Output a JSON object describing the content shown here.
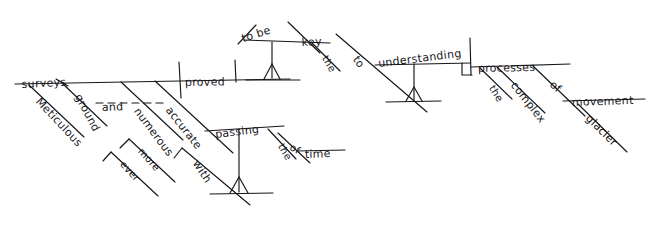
{
  "diagram": {
    "type": "reed-kellogg-sentence-diagram",
    "style": "hand-drawn-pencil",
    "ink_color": "#16161a",
    "background_color": "#ffffff",
    "sentence": "Meticulous ground-surveys, ever more numerous and accurate with the passing of time, proved to be key to understanding the complex processes of glacier movement.",
    "baseline_label": "main-clause-baseline",
    "words": [
      {
        "id": "surveys",
        "text": "surveys",
        "role": "simple-subject",
        "slot": "baseline",
        "x": 22,
        "y": 78,
        "rot": -3,
        "size": "normal"
      },
      {
        "id": "meticulous",
        "text": "Meticulous",
        "role": "adjective-modifier",
        "slot": "slant-under-subject",
        "x": 33,
        "y": 91,
        "rot": 47,
        "size": "normal"
      },
      {
        "id": "ground",
        "text": "ground",
        "role": "compound-noun-modifier",
        "slot": "slant-under-subject",
        "x": 72,
        "y": 85,
        "rot": 62,
        "size": "normal"
      },
      {
        "id": "and",
        "text": "and",
        "role": "coordinating-conjunction",
        "slot": "dashed-conjunction",
        "x": 102,
        "y": 101,
        "rot": -2,
        "size": "normal"
      },
      {
        "id": "numerous",
        "text": "numerous",
        "role": "adjective-modifier",
        "slot": "slant-under-subject",
        "x": 131,
        "y": 100,
        "rot": 53,
        "size": "normal"
      },
      {
        "id": "more",
        "text": "more",
        "role": "adverb-modifier",
        "slot": "slant-sub-branch",
        "x": 136,
        "y": 142,
        "rot": 48,
        "size": "sm"
      },
      {
        "id": "ever",
        "text": "ever",
        "role": "adverb-modifier",
        "slot": "slant-sub-branch",
        "x": 118,
        "y": 155,
        "rot": 48,
        "size": "sm"
      },
      {
        "id": "accurate",
        "text": "accurate",
        "role": "adjective-modifier",
        "slot": "slant-under-subject",
        "x": 163,
        "y": 99,
        "rot": 52,
        "size": "normal"
      },
      {
        "id": "with",
        "text": "with",
        "role": "preposition",
        "slot": "slant-sub-branch",
        "x": 190,
        "y": 152,
        "rot": 57,
        "size": "normal"
      },
      {
        "id": "passing",
        "text": "passing",
        "role": "gerund-object-of-preposition",
        "slot": "pedestal-horizontal",
        "x": 216,
        "y": 128,
        "rot": -7,
        "size": "normal"
      },
      {
        "id": "the",
        "text": "the",
        "role": "article-modifier",
        "slot": "slant-modifier",
        "x": 276,
        "y": 136,
        "rot": 60,
        "size": "sm"
      },
      {
        "id": "of",
        "text": "of",
        "role": "preposition",
        "slot": "slant-modifier",
        "x": 288,
        "y": 140,
        "rot": 30,
        "size": "sm"
      },
      {
        "id": "time",
        "text": "time",
        "role": "object-of-preposition",
        "slot": "horizontal",
        "x": 305,
        "y": 148,
        "rot": -2,
        "size": "normal"
      },
      {
        "id": "proved",
        "text": "proved",
        "role": "main-verb",
        "slot": "baseline",
        "x": 185,
        "y": 76,
        "rot": -1,
        "size": "normal"
      },
      {
        "id": "to-be",
        "text": "to be",
        "role": "infinitive-subject-complement",
        "slot": "pedestal-horizontal",
        "x": 244,
        "y": 32,
        "rot": -18,
        "size": "normal"
      },
      {
        "id": "key",
        "text": "key",
        "role": "predicate-noun",
        "slot": "pedestal-horizontal",
        "x": 302,
        "y": 36,
        "rot": -3,
        "size": "normal"
      },
      {
        "id": "the2",
        "text": "the",
        "role": "article-modifier",
        "slot": "slant-modifier",
        "x": 320,
        "y": 48,
        "rot": 60,
        "size": "sm"
      },
      {
        "id": "to",
        "text": "to",
        "role": "preposition",
        "slot": "slant-modifier",
        "x": 350,
        "y": 48,
        "rot": 55,
        "size": "normal"
      },
      {
        "id": "understanding",
        "text": "understanding",
        "role": "gerund-object-of-preposition",
        "slot": "pedestal-horizontal",
        "x": 379,
        "y": 57,
        "rot": -7,
        "size": "normal"
      },
      {
        "id": "processes",
        "text": "processes",
        "role": "direct-object-of-gerund",
        "slot": "horizontal",
        "x": 478,
        "y": 62,
        "rot": -1,
        "size": "normal"
      },
      {
        "id": "the3",
        "text": "the",
        "role": "article-modifier",
        "slot": "slant-modifier",
        "x": 487,
        "y": 78,
        "rot": 58,
        "size": "sm"
      },
      {
        "id": "complex",
        "text": "complex",
        "role": "adjective-modifier",
        "slot": "slant-modifier",
        "x": 508,
        "y": 74,
        "rot": 52,
        "size": "normal"
      },
      {
        "id": "of2",
        "text": "of",
        "role": "preposition",
        "slot": "slant-modifier",
        "x": 547,
        "y": 75,
        "rot": 40,
        "size": "normal"
      },
      {
        "id": "movement",
        "text": "movement",
        "role": "object-of-preposition",
        "slot": "horizontal",
        "x": 572,
        "y": 96,
        "rot": -2,
        "size": "normal"
      },
      {
        "id": "glacier",
        "text": "glacier",
        "role": "noun-adjunct-modifier",
        "slot": "slant-modifier",
        "x": 583,
        "y": 108,
        "rot": 45,
        "size": "normal"
      }
    ]
  }
}
